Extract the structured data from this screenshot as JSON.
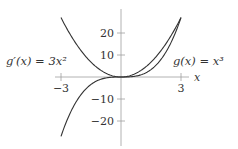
{
  "chart_data": {
    "type": "line",
    "title": "",
    "xlabel": "x",
    "ylabel": "",
    "xlim": [
      -3,
      3
    ],
    "ylim": [
      -27,
      27
    ],
    "grid": false,
    "legend": "none",
    "x_ticks": [
      -3,
      3
    ],
    "x_tick_labels": [
      "−3",
      "3"
    ],
    "y_ticks": [
      20,
      10,
      -10,
      -20
    ],
    "y_tick_labels": [
      "20",
      "10",
      "−10",
      "−20"
    ],
    "series": [
      {
        "name": "g(x) = x^3",
        "label_text": "g(x) = x³",
        "expr": "x^3",
        "x": [
          -3,
          -2,
          -1,
          0,
          1,
          2,
          3
        ],
        "values": [
          -27,
          -8,
          -1,
          0,
          1,
          8,
          27
        ]
      },
      {
        "name": "g'(x) = 3x^2",
        "label_text": "g′(x) = 3x²",
        "expr": "3x^2",
        "x": [
          -3,
          -2,
          -1,
          0,
          1,
          2,
          3
        ],
        "values": [
          27,
          12,
          3,
          0,
          3,
          12,
          27
        ]
      }
    ],
    "annotations": [
      "g′(x) = 3x²",
      "g(x) = x³"
    ]
  },
  "colors": {
    "axis": "#999999",
    "curve": "#333333",
    "text": "#333333"
  },
  "labels": {
    "x_axis": "x",
    "tick_neg3": "−3",
    "tick_3": "3",
    "tick_20": "20",
    "tick_10": "10",
    "tick_neg10": "−10",
    "tick_neg20": "−20",
    "deriv_label": "g′(x) = 3x²",
    "func_label": "g(x) = x³"
  }
}
